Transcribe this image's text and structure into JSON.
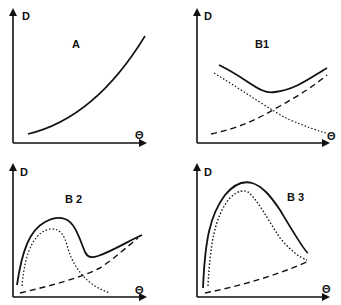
{
  "panels": [
    {
      "id": "A",
      "title": "A",
      "y_axis": "D",
      "x_axis": "Θ",
      "curves": [
        {
          "style": "solid",
          "shape": "increasing convex"
        }
      ]
    },
    {
      "id": "B1",
      "title": "B1",
      "y_axis": "D",
      "x_axis": "Θ",
      "curves": [
        {
          "style": "solid",
          "shape": "U-shaped minimum"
        },
        {
          "style": "dotted",
          "shape": "decreasing"
        },
        {
          "style": "dashed",
          "shape": "increasing"
        }
      ]
    },
    {
      "id": "B2",
      "title": "B 2",
      "y_axis": "D",
      "x_axis": "Θ",
      "curves": [
        {
          "style": "solid",
          "shape": "peak then dip then rise"
        },
        {
          "style": "dotted",
          "shape": "peak then decay"
        },
        {
          "style": "dashed",
          "shape": "increasing linear"
        }
      ]
    },
    {
      "id": "B3",
      "title": "B 3",
      "y_axis": "D",
      "x_axis": "Θ",
      "curves": [
        {
          "style": "solid",
          "shape": "broad peak"
        },
        {
          "style": "dotted",
          "shape": "broad peak inner"
        },
        {
          "style": "dashed",
          "shape": "increasing linear"
        }
      ]
    }
  ]
}
